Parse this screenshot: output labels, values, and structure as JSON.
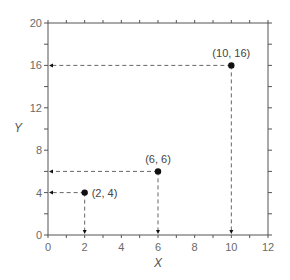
{
  "chart_data": {
    "type": "scatter",
    "title": "",
    "xlabel": "X",
    "ylabel": "Y",
    "xlim": [
      0,
      12
    ],
    "ylim": [
      0,
      20
    ],
    "x_ticks": [
      0,
      2,
      4,
      6,
      8,
      10,
      12
    ],
    "y_ticks": [
      0,
      4,
      8,
      12,
      16,
      20
    ],
    "x_minor_step": 1,
    "y_minor_step": 2,
    "grid": false,
    "series": [
      {
        "name": "points",
        "points": [
          {
            "x": 2,
            "y": 4,
            "label": "(2, 4)"
          },
          {
            "x": 6,
            "y": 6,
            "label": "(6, 6)"
          },
          {
            "x": 10,
            "y": 16,
            "label": "(10, 16)"
          }
        ]
      }
    ],
    "annotations": "Dashed projection lines with arrows from each point to the X and Y axes"
  },
  "colors": {
    "axis": "#555555",
    "point": "#111111",
    "dash": "#666666"
  }
}
